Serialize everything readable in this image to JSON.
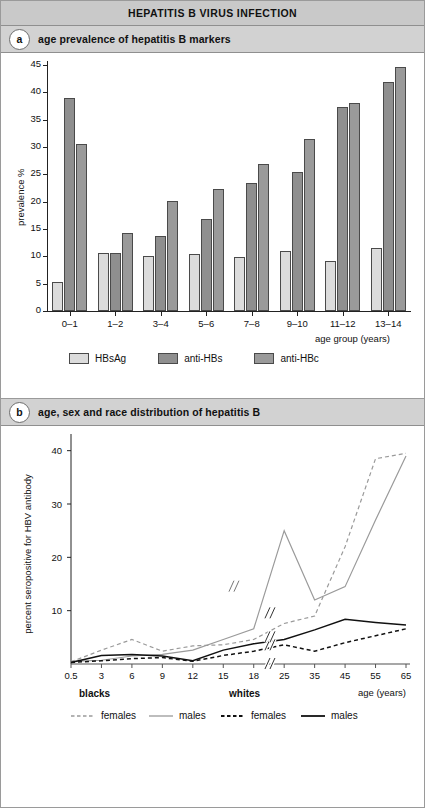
{
  "figure": {
    "title": "HEPATITIS B VIRUS INFECTION"
  },
  "panel_a": {
    "badge": "a",
    "heading": "age prevalence of hepatitis B markers"
  },
  "panel_b": {
    "badge": "b",
    "heading": "age, sex and race distribution of hepatitis B"
  },
  "legend_a": [
    {
      "label": "HBsAg",
      "color": "#dcdcdc"
    },
    {
      "label": "anti-HBs",
      "color": "#8f8f8f"
    },
    {
      "label": "anti-HBc",
      "color": "#9a9a9a"
    }
  ],
  "legend_b": {
    "group1_title": "blacks",
    "group2_title": "whites",
    "items": [
      {
        "label": "females",
        "style": "dashed",
        "color": "#9a9a9a"
      },
      {
        "label": "males",
        "style": "solid",
        "color": "#9a9a9a"
      },
      {
        "label": "females",
        "style": "dashed",
        "color": "#111111"
      },
      {
        "label": "males",
        "style": "solid",
        "color": "#111111"
      }
    ]
  },
  "chart_data": [
    {
      "type": "bar",
      "title": "age prevalence of hepatitis B markers",
      "xlabel": "age group (years)",
      "ylabel": "prevalence %",
      "ylim": [
        0,
        45
      ],
      "yticks": [
        0,
        5,
        10,
        15,
        20,
        25,
        30,
        35,
        40,
        45
      ],
      "grid": false,
      "legend_position": "bottom",
      "categories": [
        "0–1",
        "1–2",
        "3–4",
        "5–6",
        "7–8",
        "9–10",
        "11–12",
        "13–14"
      ],
      "series": [
        {
          "name": "HBsAg",
          "color": "#dcdcdc",
          "values": [
            5.3,
            10.6,
            10.1,
            10.5,
            9.9,
            11.0,
            9.2,
            11.5
          ]
        },
        {
          "name": "anti-HBs",
          "color": "#8f8f8f",
          "values": [
            39.0,
            10.7,
            13.7,
            16.8,
            23.4,
            25.4,
            37.4,
            41.8
          ]
        },
        {
          "name": "anti-HBc",
          "color": "#9a9a9a",
          "values": [
            30.5,
            14.3,
            20.1,
            22.3,
            26.8,
            31.5,
            38.0,
            44.6
          ]
        }
      ]
    },
    {
      "type": "line",
      "title": "age, sex and race distribution of hepatitis B",
      "xlabel": "age (years)",
      "ylabel": "percent seropositive for HBV antibody",
      "ylim": [
        0,
        42
      ],
      "yticks": [
        10,
        20,
        30,
        40
      ],
      "grid": false,
      "axis_break": "between 18 and 25",
      "legend_position": "below-plot",
      "x": [
        0.5,
        3,
        6,
        9,
        12,
        15,
        18,
        25,
        35,
        45,
        55,
        65
      ],
      "xticklabels": [
        "0.5",
        "3",
        "6",
        "9",
        "12",
        "15",
        "18",
        "25",
        "35",
        "45",
        "55",
        "65"
      ],
      "series": [
        {
          "name": "blacks females",
          "style": "dashed",
          "color": "#9a9a9a",
          "values": [
            0.4,
            2.6,
            4.6,
            2.4,
            3.4,
            3.6,
            4.6,
            7.6,
            9.0,
            22.0,
            38.5,
            39.5
          ]
        },
        {
          "name": "blacks males",
          "style": "solid",
          "color": "#9a9a9a",
          "values": [
            0.5,
            0.7,
            1.5,
            1.8,
            2.6,
            4.6,
            6.6,
            25.0,
            12.0,
            14.5,
            27.0,
            39.0
          ]
        },
        {
          "name": "whites females",
          "style": "dashed",
          "color": "#111111",
          "values": [
            0.3,
            0.6,
            1.0,
            1.2,
            0.5,
            1.6,
            2.4,
            3.6,
            2.4,
            4.0,
            5.3,
            6.6
          ]
        },
        {
          "name": "whites males",
          "style": "solid",
          "color": "#111111",
          "values": [
            0.3,
            1.6,
            1.8,
            1.5,
            0.6,
            2.6,
            3.8,
            4.6,
            6.4,
            8.4,
            7.8,
            7.3
          ]
        }
      ]
    }
  ]
}
